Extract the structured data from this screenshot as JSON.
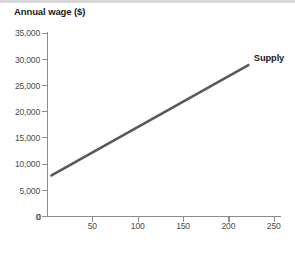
{
  "chart_data": {
    "type": "line",
    "title": "",
    "xlabel": "Farm workers (thousands)",
    "ylabel": "Annual wage ($)",
    "xlim": [
      0,
      258
    ],
    "ylim": [
      0,
      36500
    ],
    "grid": false,
    "legend_position": "inline-right-end",
    "x_ticks": [
      {
        "value": 0,
        "label": "0"
      },
      {
        "value": 50,
        "label": "50"
      },
      {
        "value": 100,
        "label": "100"
      },
      {
        "value": 150,
        "label": "150"
      },
      {
        "value": 200,
        "label": "200"
      },
      {
        "value": 250,
        "label": "250"
      }
    ],
    "y_ticks": [
      {
        "value": 0,
        "label": "0"
      },
      {
        "value": 5000,
        "label": "5,000"
      },
      {
        "value": 10000,
        "label": "10,000"
      },
      {
        "value": 15000,
        "label": "15,000"
      },
      {
        "value": 20000,
        "label": "20,000"
      },
      {
        "value": 25000,
        "label": "25,000"
      },
      {
        "value": 30000,
        "label": "30,000"
      },
      {
        "value": 35000,
        "label": "35,000"
      }
    ],
    "series": [
      {
        "name": "Supply",
        "color": "#595959",
        "line_width": 2.6,
        "points": [
          {
            "x": 5,
            "y": 8000
          },
          {
            "x": 222,
            "y": 30000
          }
        ]
      }
    ],
    "annotations": [
      {
        "name": "supply-curve-label",
        "text": "Supply",
        "x": 228,
        "y": 31200
      }
    ]
  },
  "colors": {
    "axis": "#8c8c8c",
    "tick_text": "#4d4d4d",
    "title_text": "#1a1a1a",
    "series": "#595959",
    "background": "#ffffff",
    "top_strip": "#d9d9d9"
  }
}
